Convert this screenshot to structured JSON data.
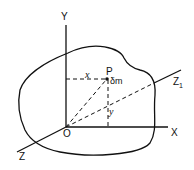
{
  "diagram": {
    "labels": {
      "y_axis": "Y",
      "x_axis": "X",
      "origin": "O",
      "z_axis": "Z",
      "z1_axis": "Z",
      "z1_sub": "1",
      "point": "P",
      "mass_element": "δm",
      "x_dist": "x",
      "y_dist": "y"
    },
    "colors": {
      "line": "#111111",
      "background": "#ffffff"
    }
  }
}
